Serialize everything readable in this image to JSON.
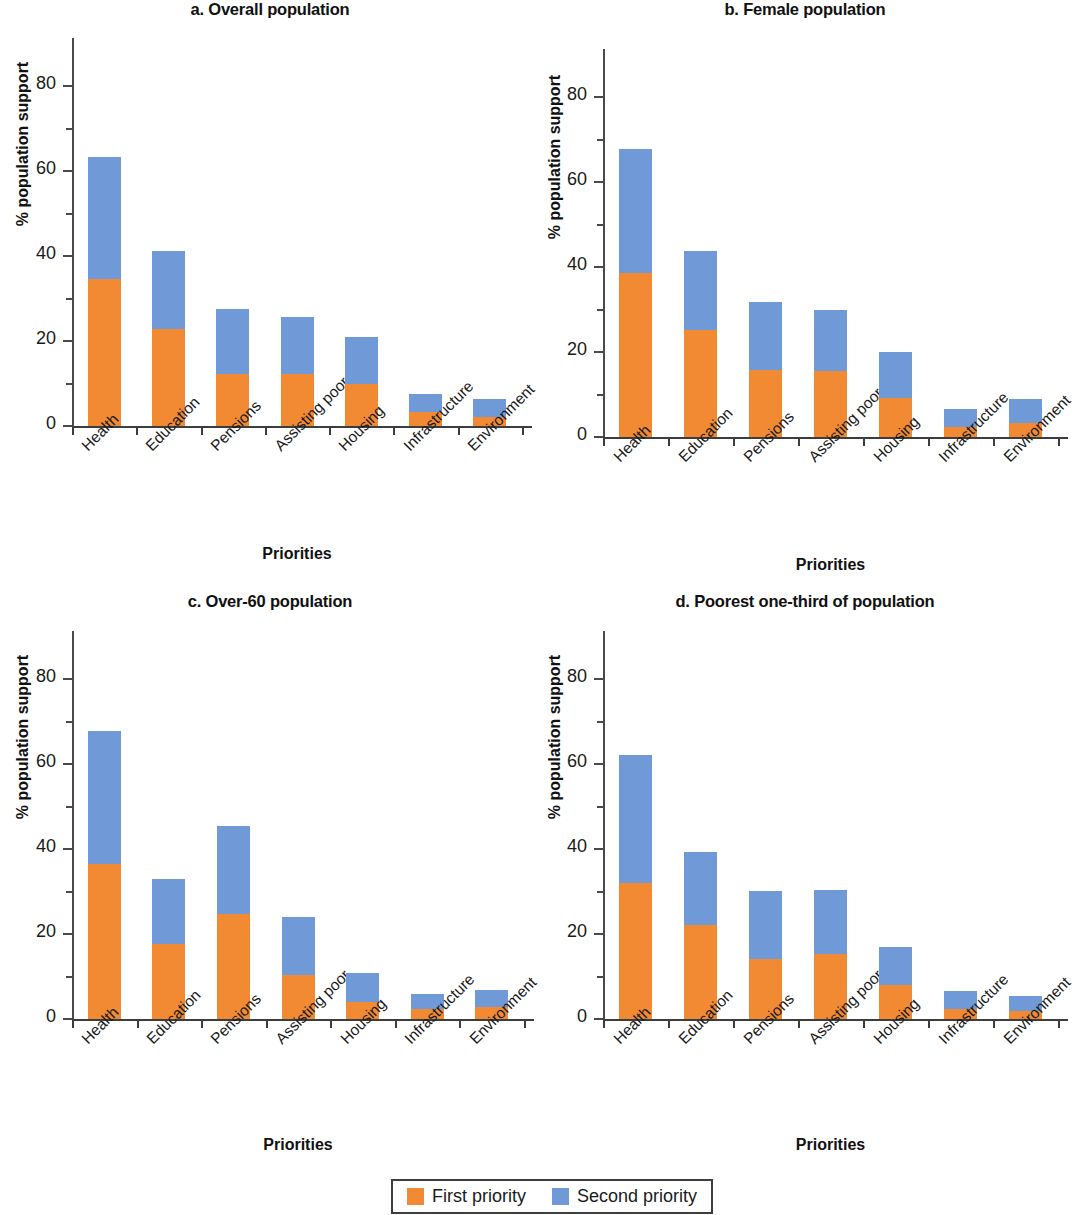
{
  "figure": {
    "categories": [
      "Health",
      "Education",
      "Pensions",
      "Assisting poor",
      "Housing",
      "Infrastructure",
      "Environment"
    ],
    "ylabel": "% population support",
    "xlabel": "Priorities",
    "yticks": [
      "0",
      "20",
      "40",
      "60",
      "80"
    ],
    "legend": {
      "first_label": "First priority",
      "second_label": "Second priority",
      "first_color": "#f18a33",
      "second_color": "#7099d8"
    }
  },
  "chart_data": [
    {
      "type": "bar",
      "id": "panel-a",
      "title": "a. Overall population",
      "xlabel": "Priorities",
      "ylabel": "% population support",
      "ylim": [
        0,
        88
      ],
      "yticks": [
        0,
        20,
        40,
        60,
        80
      ],
      "grid": false,
      "stacked": true,
      "legend_position": "figure-bottom-center",
      "categories": [
        "Health",
        "Education",
        "Pensions",
        "Assisting poor",
        "Housing",
        "Infrastructure",
        "Environment"
      ],
      "series": [
        {
          "name": "First priority",
          "color": "#f18a33",
          "values": [
            34.5,
            22.8,
            12.3,
            12.2,
            9.8,
            3.4,
            2.2
          ]
        },
        {
          "name": "Second priority",
          "color": "#7099d8",
          "values": [
            28.8,
            18.3,
            15.2,
            13.5,
            11.1,
            4.1,
            4.1
          ]
        }
      ],
      "totals": [
        63.3,
        41.1,
        27.5,
        25.7,
        20.9,
        7.5,
        6.3
      ]
    },
    {
      "type": "bar",
      "id": "panel-b",
      "title": "b. Female population",
      "xlabel": "Priorities",
      "ylabel": "% population support",
      "ylim": [
        0,
        88
      ],
      "yticks": [
        0,
        20,
        40,
        60,
        80
      ],
      "grid": false,
      "stacked": true,
      "legend_position": "figure-bottom-center",
      "categories": [
        "Health",
        "Education",
        "Pensions",
        "Assisting poor",
        "Housing",
        "Infrastructure",
        "Environment"
      ],
      "series": [
        {
          "name": "First priority",
          "color": "#f18a33",
          "values": [
            38.6,
            25.2,
            15.7,
            15.5,
            9.1,
            2.4,
            3.4
          ]
        },
        {
          "name": "Second priority",
          "color": "#7099d8",
          "values": [
            29.1,
            18.6,
            16.1,
            14.3,
            11.0,
            4.2,
            5.5
          ]
        }
      ],
      "totals": [
        67.7,
        43.8,
        31.8,
        29.8,
        20.1,
        6.6,
        8.9
      ]
    },
    {
      "type": "bar",
      "id": "panel-c",
      "title": "c. Over-60 population",
      "xlabel": "Priorities",
      "ylabel": "% population support",
      "ylim": [
        0,
        88
      ],
      "yticks": [
        0,
        20,
        40,
        60,
        80
      ],
      "grid": false,
      "stacked": true,
      "legend_position": "figure-bottom-center",
      "categories": [
        "Health",
        "Education",
        "Pensions",
        "Assisting poor",
        "Housing",
        "Infrastructure",
        "Environment"
      ],
      "series": [
        {
          "name": "First priority",
          "color": "#f18a33",
          "values": [
            36.5,
            17.6,
            24.6,
            10.4,
            4.0,
            2.4,
            2.9
          ]
        },
        {
          "name": "Second priority",
          "color": "#7099d8",
          "values": [
            31.2,
            15.4,
            20.9,
            13.5,
            6.9,
            3.6,
            3.9
          ]
        }
      ],
      "totals": [
        67.7,
        33.0,
        45.5,
        23.9,
        10.9,
        6.0,
        6.8
      ]
    },
    {
      "type": "bar",
      "id": "panel-d",
      "title": "d. Poorest one-third of population",
      "xlabel": "Priorities",
      "ylabel": "% population support",
      "ylim": [
        0,
        88
      ],
      "yticks": [
        0,
        20,
        40,
        60,
        80
      ],
      "grid": false,
      "stacked": true,
      "legend_position": "figure-bottom-center",
      "categories": [
        "Health",
        "Education",
        "Pensions",
        "Assisting poor",
        "Housing",
        "Infrastructure",
        "Environment"
      ],
      "series": [
        {
          "name": "First priority",
          "color": "#f18a33",
          "values": [
            32.0,
            22.1,
            14.2,
            15.2,
            7.9,
            2.4,
            2.0
          ]
        },
        {
          "name": "Second priority",
          "color": "#7099d8",
          "values": [
            30.2,
            17.1,
            16.0,
            15.1,
            9.1,
            4.1,
            3.5
          ]
        }
      ],
      "totals": [
        62.2,
        39.2,
        30.2,
        30.3,
        17.0,
        6.5,
        5.5
      ]
    }
  ]
}
